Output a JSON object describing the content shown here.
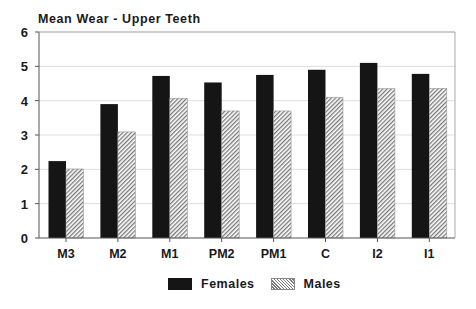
{
  "chart_data": {
    "type": "bar",
    "title": "Mean Wear - Upper Teeth",
    "xlabel": "",
    "ylabel": "",
    "categories": [
      "M3",
      "M2",
      "M1",
      "PM2",
      "PM1",
      "C",
      "I2",
      "I1"
    ],
    "series": [
      {
        "name": "Females",
        "values": [
          2.24,
          3.9,
          4.72,
          4.53,
          4.75,
          4.9,
          5.1,
          4.78
        ],
        "fill": "#151515"
      },
      {
        "name": "Males",
        "values": [
          2.01,
          3.09,
          4.07,
          3.7,
          3.7,
          4.1,
          4.35,
          4.36
        ],
        "fill": "hatched"
      }
    ],
    "ylim": [
      0,
      6
    ],
    "yticks": [
      0,
      1,
      2,
      3,
      4,
      5,
      6
    ],
    "grid": true,
    "legend_position": "bottom"
  },
  "legend": {
    "females_label": "Females",
    "males_label": "Males"
  },
  "colors": {
    "female_fill": "#151515",
    "male_hatch": "#7a7a7a",
    "axis": "#555555",
    "grid": "#dddddd"
  }
}
